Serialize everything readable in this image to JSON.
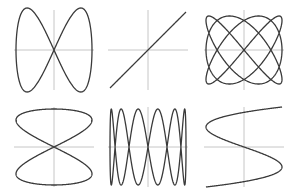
{
  "figure": {
    "title": "",
    "background": "#ffffff",
    "axis_color": "#b8b8b8",
    "curve_color": "#3a3a3a",
    "panels": [
      {
        "name": "lissajous-1-2",
        "cx": 54,
        "cy": 50,
        "rx": 38,
        "ry": 42,
        "a": 1,
        "b": 2,
        "delta": 0,
        "t0": 0,
        "t1": 6.2832
      },
      {
        "name": "lissajous-1-1",
        "cx": 148,
        "cy": 50,
        "rx": 38,
        "ry": 38,
        "a": 1,
        "b": 1,
        "delta": 0,
        "t0": 0,
        "t1": 6.2832
      },
      {
        "name": "lissajous-3-4",
        "cx": 244,
        "cy": 50,
        "rx": 38,
        "ry": 34,
        "a": 3,
        "b": 4,
        "delta": 1.5708,
        "t0": 0,
        "t1": 6.2832
      },
      {
        "name": "lissajous-2-1",
        "cx": 54,
        "cy": 147,
        "rx": 38,
        "ry": 38,
        "a": 2,
        "b": 1,
        "delta": 0,
        "t0": 0,
        "t1": 6.2832
      },
      {
        "name": "lissajous-1-6",
        "cx": 148,
        "cy": 147,
        "rx": 38,
        "ry": 38,
        "a": 1,
        "b": 6,
        "delta": 1.5708,
        "t0": 0,
        "t1": 6.2832
      },
      {
        "name": "lissajous-3-1-open",
        "cx": 244,
        "cy": 147,
        "rx": 38,
        "ry": 40,
        "a": 3,
        "b": 1,
        "delta": 3.1416,
        "t0": -1.5708,
        "t1": 1.5708
      }
    ],
    "axis_half_extent": 40
  }
}
